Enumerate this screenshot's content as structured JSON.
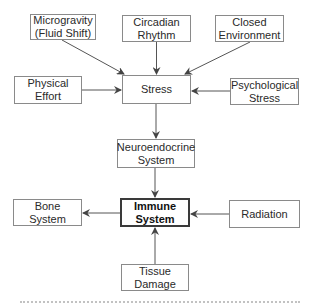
{
  "diagram": {
    "colors": {
      "box_border": "#8a8a8a",
      "emphasis_border": "#3a3a3a",
      "arrow": "#555555",
      "text": "#2a2a2a"
    },
    "nodes": {
      "microgravity": {
        "label": "Microgravity\n(Fluid Shift)",
        "x": 30,
        "y": 14,
        "w": 66,
        "h": 26
      },
      "circadian": {
        "label": "Circadian\nRhythm",
        "x": 122,
        "y": 15,
        "w": 69,
        "h": 27
      },
      "closed_env": {
        "label": "Closed\nEnvironment",
        "x": 215,
        "y": 15,
        "w": 69,
        "h": 27
      },
      "physical_effort": {
        "label": "Physical\nEffort",
        "x": 14,
        "y": 76,
        "w": 68,
        "h": 28
      },
      "stress": {
        "label": "Stress",
        "x": 122,
        "y": 75,
        "w": 69,
        "h": 29
      },
      "psych_stress": {
        "label": "Psychological\nStress",
        "x": 230,
        "y": 78,
        "w": 69,
        "h": 27
      },
      "neuroendocrine": {
        "label": "Neuroendocrine\nSystem",
        "x": 117,
        "y": 139,
        "w": 78,
        "h": 29
      },
      "bone": {
        "label": "Bone\nSystem",
        "x": 13,
        "y": 199,
        "w": 69,
        "h": 27
      },
      "immune": {
        "label": "Immune\nSystem",
        "x": 120,
        "y": 198,
        "w": 70,
        "h": 29
      },
      "radiation": {
        "label": "Radiation",
        "x": 229,
        "y": 200,
        "w": 71,
        "h": 28
      },
      "tissue_damage": {
        "label": "Tissue\nDamage",
        "x": 121,
        "y": 264,
        "w": 68,
        "h": 27
      }
    },
    "edges": [
      {
        "from": "Microgravity (Fluid Shift)",
        "to": "Stress"
      },
      {
        "from": "Circadian Rhythm",
        "to": "Stress"
      },
      {
        "from": "Closed Environment",
        "to": "Stress"
      },
      {
        "from": "Physical Effort",
        "to": "Stress"
      },
      {
        "from": "Psychological Stress",
        "to": "Stress"
      },
      {
        "from": "Stress",
        "to": "Neuroendocrine System"
      },
      {
        "from": "Neuroendocrine System",
        "to": "Immune System"
      },
      {
        "from": "Immune System",
        "to": "Bone System"
      },
      {
        "from": "Radiation",
        "to": "Immune System"
      },
      {
        "from": "Tissue Damage",
        "to": "Immune System"
      }
    ]
  }
}
